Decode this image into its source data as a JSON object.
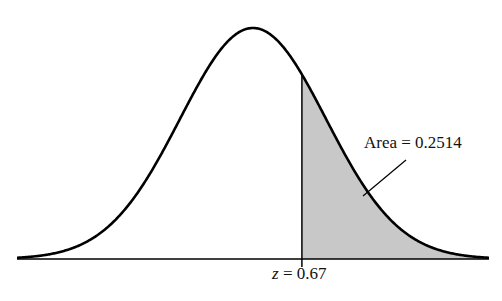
{
  "chart_data": {
    "type": "area",
    "title": "",
    "distribution": "standard normal",
    "mean": 0,
    "sd": 1,
    "shaded_region": {
      "from_z": 0.67,
      "to_z": "inf",
      "area": 0.2514
    },
    "annotations": [
      "Area = 0.2514",
      "z = 0.67"
    ],
    "xlabel": "",
    "ylabel": "",
    "grid": false,
    "colors": {
      "curve": "#000000",
      "shade": "#c8c8c8",
      "axis": "#000000"
    }
  },
  "labels": {
    "area_text": "Area = 0.2514",
    "z_var": "z",
    "z_eq": " = 0.67"
  }
}
